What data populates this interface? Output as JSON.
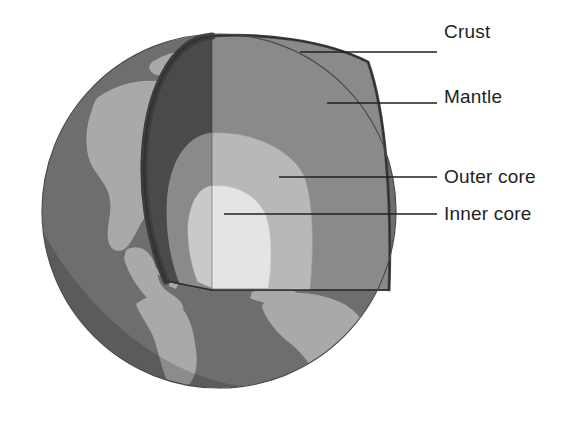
{
  "diagram": {
    "type": "cutaway-cross-section",
    "background_color": "#ffffff",
    "canvas": {
      "width": 567,
      "height": 423
    }
  },
  "globe": {
    "center_x": 219,
    "center_y": 211,
    "radius": 177,
    "ocean_color": "#6e6e6e",
    "land_color": "#a8a8a8",
    "shadow_color": "#4f4f4f",
    "outline_color": "#4a4a4a"
  },
  "layers": [
    {
      "id": "crust",
      "label": "Crust",
      "order": 1,
      "rim_color": "#3d3d3d",
      "description": "thin dark outer rim along cut edge"
    },
    {
      "id": "mantle",
      "label": "Mantle",
      "order": 2,
      "left_face_color": "#4a4a4a",
      "right_face_color": "#8a8a8a",
      "top_plane_color": "#6e6e6e",
      "radius": 170
    },
    {
      "id": "outer_core",
      "label": "Outer core",
      "order": 3,
      "left_face_color": "#8a8a8a",
      "right_face_color": "#b8b8b8",
      "radius": 108
    },
    {
      "id": "inner_core",
      "label": "Inner core",
      "order": 4,
      "left_face_color": "#c8c8c8",
      "right_face_color": "#e2e2e2",
      "radius": 62
    }
  ],
  "leader_lines": [
    {
      "id": "crust",
      "x1": 300,
      "y1": 52,
      "x2": 437,
      "y2": 52
    },
    {
      "id": "mantle",
      "x1": 327,
      "y1": 103,
      "x2": 437,
      "y2": 103
    },
    {
      "id": "outer_core",
      "x1": 279,
      "y1": 177,
      "x2": 437,
      "y2": 177
    },
    {
      "id": "inner_core",
      "x1": 224,
      "y1": 214,
      "x2": 437,
      "y2": 214
    }
  ],
  "style": {
    "line_color": "#231f20",
    "line_width": 1.6,
    "label_color": "#231f20",
    "label_font_size": 19
  }
}
